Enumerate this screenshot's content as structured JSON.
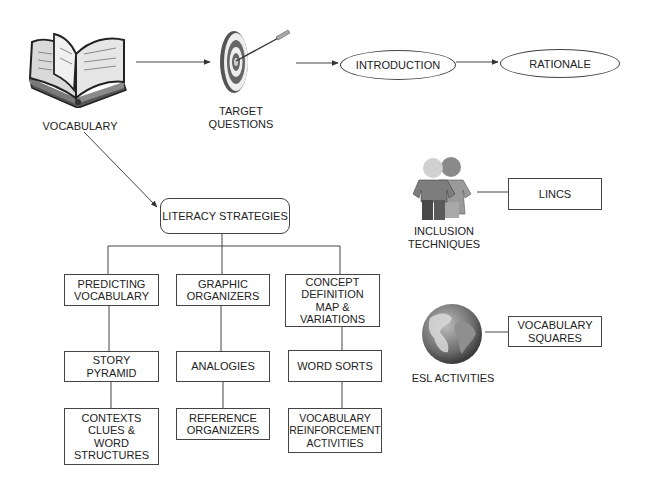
{
  "flow": {
    "vocabulary_label": "VOCABULARY",
    "target_label": "TARGET\nQUESTIONS",
    "introduction_label": "INTRODUCTION",
    "rationale_label": "RATIONALE"
  },
  "literacy": {
    "root_label": "LITERACY STRATEGIES",
    "columns": [
      {
        "items": [
          "PREDICTING\nVOCABULARY",
          "STORY\nPYRAMID",
          "CONTEXTS\nCLUES &\nWORD\nSTRUCTURES"
        ]
      },
      {
        "items": [
          "GRAPHIC\nORGANIZERS",
          "ANALOGIES",
          "REFERENCE\nORGANIZERS"
        ]
      },
      {
        "items": [
          "CONCEPT\nDEFINITION\nMAP &\nVARIATIONS",
          "WORD SORTS",
          "VOCABULARY\nREINFORCEMENT\nACTIVITIES"
        ]
      }
    ]
  },
  "inclusion": {
    "label": "INCLUSION\nTECHNIQUES",
    "linked_box": "LINCS"
  },
  "esl": {
    "label": "ESL ACTIVITIES",
    "linked_box": "VOCABULARY\nSQUARES"
  },
  "icons": {
    "book": "open-book-icon",
    "target": "target-dartboard-icon",
    "people": "two-people-icon",
    "globe": "globe-icon"
  },
  "colors": {
    "line": "#444444",
    "icon_dark": "#3a3a3a",
    "icon_mid": "#7a7a7a",
    "icon_light": "#c8c8c8"
  }
}
